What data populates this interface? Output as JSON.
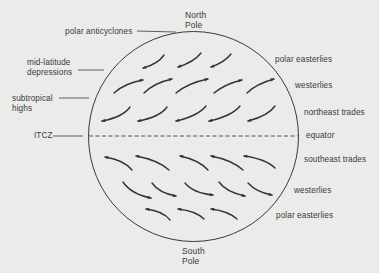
{
  "diagram": {
    "poles": {
      "north": [
        "North",
        "Pole"
      ],
      "south": [
        "South",
        "Pole"
      ]
    },
    "left_labels": {
      "polar_anticyclones": "polar anticyclones",
      "mid_latitude": [
        "mid-latitude",
        "depressions"
      ],
      "subtropical": [
        "subtropical",
        "highs"
      ],
      "itcz": "ITCZ"
    },
    "right_labels": {
      "n_polar_easterlies": "polar easterlies",
      "n_westerlies": "westerlies",
      "northeast_trades": "northeast trades",
      "equator": "equator",
      "southeast_trades": "southeast trades",
      "s_westerlies": "westerlies",
      "s_polar_easterlies": "polar easterlies"
    },
    "colors": {
      "background": "#ebebea",
      "ink": "#3a3a3a"
    },
    "wind_rows": [
      {
        "name": "north-polar-easterlies",
        "direction": "to-southwest",
        "count": 3
      },
      {
        "name": "north-westerlies",
        "direction": "to-northeast",
        "count": 5
      },
      {
        "name": "northeast-trades",
        "direction": "to-southwest",
        "count": 5
      },
      {
        "name": "southeast-trades",
        "direction": "to-northwest",
        "count": 5
      },
      {
        "name": "south-westerlies",
        "direction": "to-southeast",
        "count": 5
      },
      {
        "name": "south-polar-easterlies",
        "direction": "to-northwest",
        "count": 3
      }
    ]
  }
}
